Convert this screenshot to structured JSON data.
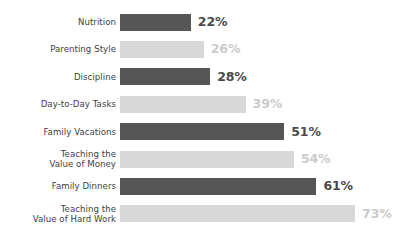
{
  "chart_data": {
    "type": "bar",
    "orientation": "horizontal",
    "title": "",
    "subtitle": "",
    "xlabel": "",
    "ylabel": "",
    "xlim": [
      0,
      80
    ],
    "grid": false,
    "legend": null,
    "value_suffix": "%",
    "categories": [
      "Nutrition",
      "Parenting Style",
      "Discipline",
      "Day-to-Day Tasks",
      "Family Vacations",
      "Teaching the\nValue of Money",
      "Family Dinners",
      "Teaching the\nValue of Hard Work"
    ],
    "values": [
      22,
      26,
      28,
      39,
      51,
      54,
      61,
      73
    ],
    "value_labels": [
      "22%",
      "26%",
      "28%",
      "39%",
      "51%",
      "54%",
      "61%",
      "73%"
    ],
    "bar_styles": [
      "dark",
      "light",
      "dark",
      "light",
      "dark",
      "light",
      "dark",
      "light"
    ],
    "colors": {
      "bar_dark": "#565656",
      "bar_light": "#d8d8d8",
      "value_dark": "#4a4a4a",
      "value_light": "#cacaca",
      "category_label": "#3d3d3d",
      "background": "#ffffff"
    },
    "bars": [
      {
        "category": "Nutrition",
        "value": 22,
        "label": "22%",
        "style": "dark"
      },
      {
        "category": "Parenting Style",
        "value": 26,
        "label": "26%",
        "style": "light"
      },
      {
        "category": "Discipline",
        "value": 28,
        "label": "28%",
        "style": "dark"
      },
      {
        "category": "Day-to-Day Tasks",
        "value": 39,
        "label": "39%",
        "style": "light"
      },
      {
        "category": "Family Vacations",
        "value": 51,
        "label": "51%",
        "style": "dark"
      },
      {
        "category": "Teaching the Value of Money",
        "value": 54,
        "label": "54%",
        "style": "light"
      },
      {
        "category": "Family Dinners",
        "value": 61,
        "label": "61%",
        "style": "dark"
      },
      {
        "category": "Teaching the Value of Hard Work",
        "value": 73,
        "label": "73%",
        "style": "light"
      }
    ]
  }
}
